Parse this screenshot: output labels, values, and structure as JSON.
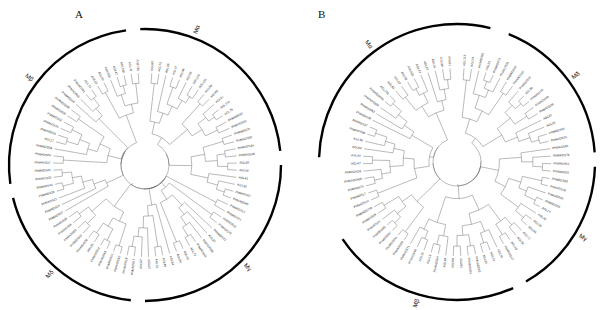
{
  "figure": {
    "background": "#ffffff",
    "width": 610,
    "height": 310,
    "branch_color": "#5a5a5a",
    "arc_color": "#000000",
    "label_color": "#2c2c2c"
  },
  "panels": [
    {
      "id": "A",
      "letter": "A",
      "letter_pos": {
        "x": 75,
        "y": 18
      },
      "center": {
        "x": 145,
        "y": 165
      },
      "radius": 142,
      "inner_radius": 22,
      "tip_radius": 92,
      "arc_radius": 136,
      "clades": [
        {
          "name": "Mδ",
          "label": "Mδ",
          "start_deg": 186,
          "end_deg": 256,
          "label_deg": 221
        },
        {
          "name": "Mβ",
          "label": "Mβ",
          "start_deg": 262,
          "end_deg": 352,
          "label_deg": 307
        },
        {
          "name": "Mα",
          "label": "Mα",
          "start_deg": 358,
          "end_deg": 84,
          "label_deg": 21
        },
        {
          "name": "Mγ",
          "label": "Mγ",
          "start_deg": 90,
          "end_deg": 180,
          "label_deg": 135
        }
      ],
      "tips": [
        "AGL63",
        "AGL73",
        "AGL56",
        "AGL67",
        "AGL96",
        "AGL58",
        "AGL102",
        "AGL101",
        "AGL59",
        "AGL93",
        "AGL91",
        "AGL104",
        "AGL79",
        "PhMADS22",
        "PhMADS45",
        "PhMADS29",
        "PhMADS30",
        "PhMADS34",
        "PhMADS49",
        "AGL40",
        "AGL90",
        "AGL41",
        "AGL92",
        "PhMADS57",
        "PhMADS60",
        "PhMADS12",
        "PhMADS74",
        "PhMADS11",
        "PhMADS70",
        "PhMADS72",
        "AGL30",
        "PhMADS38",
        "PhMADS41",
        "AGL72",
        "AGL62",
        "AGL80",
        "AGL84",
        "AGL46",
        "AGL61",
        "AGL52",
        "AGL87",
        "PhMADS17",
        "PhMADS18",
        "PhMADS62",
        "PhMADS51",
        "PhMADS65",
        "PhMADS24",
        "AGL26",
        "PhMADS09",
        "PhMADS03",
        "PhMADS69",
        "PhMADS64",
        "PhMADS35",
        "PhMADS27",
        "PhMADS54",
        "PhMADS21",
        "PhMADS39",
        "PhMADS44",
        "PhMADS20",
        "PhMADS43",
        "PhMADS07",
        "PhMADS56",
        "PhMADS58",
        "AGL17",
        "PhMADS19",
        "PhMADS25",
        "PhMADS02",
        "PhMADS05",
        "PhMADS58b",
        "PhMADS04",
        "PhMADS63",
        "PhMADS81",
        "AGL74",
        "AGL33",
        "AGL50",
        "AGL92b",
        "AGL47",
        "AGL56b",
        "AGL71",
        "AGL73b"
      ]
    },
    {
      "id": "B",
      "letter": "B",
      "letter_pos": {
        "x": 318,
        "y": 18
      },
      "center": {
        "x": 457,
        "y": 162
      },
      "radius": 145,
      "inner_radius": 22,
      "tip_radius": 94,
      "arc_radius": 138,
      "clades": [
        {
          "name": "Mβ",
          "label": "Mβ",
          "start_deg": 156,
          "end_deg": 236,
          "label_deg": 196
        },
        {
          "name": "Mγ",
          "label": "Mγ",
          "start_deg": 92,
          "end_deg": 150,
          "label_deg": 121
        },
        {
          "name": "Mδ",
          "label": "Mδ",
          "start_deg": 22,
          "end_deg": 86,
          "label_deg": 54
        },
        {
          "name": "Mα",
          "label": "Mα",
          "start_deg": 272,
          "end_deg": 14,
          "label_deg": 323
        }
      ],
      "tips": [
        "AGL113",
        "AGL24",
        "PhMADS01",
        "AGL59",
        "PhMADS73",
        "PhMADS31",
        "PhMADS02",
        "PhMADS42",
        "PhMADS32",
        "AGL29",
        "PhMADS06",
        "PhMADS36",
        "PhMADS08",
        "AGL97",
        "AGL35",
        "PhMADS44",
        "PhMADS33",
        "PhMADS61",
        "PhMADS78",
        "PhMADS51",
        "PhMADS92",
        "PhMADS25",
        "PhMADS38",
        "PhMADS34",
        "PhMADS63",
        "AGL74",
        "AGL33",
        "AGL30",
        "AGL56",
        "AGL72",
        "AGL52",
        "AGL39",
        "PhMADS67",
        "AGL34",
        "AGL31",
        "AGL20",
        "PhMADS43",
        "PhMADS04",
        "AGL62",
        "AGL80",
        "AGL84",
        "PhMADS64",
        "AGL16",
        "AGL22",
        "PhMADS48",
        "PhMADS71",
        "PhMADS60",
        "PhMADS54",
        "PhMADS57",
        "PhMADS65",
        "PhMADS41",
        "PhMADS09",
        "PhMADS73b",
        "PhMADS14",
        "PhMADS17",
        "PhMADS75",
        "PhMADS60b",
        "PhMADS26",
        "AGL47",
        "AGL92",
        "AGL64",
        "AGL50",
        "PhMADS58",
        "PhMADS37",
        "PhMADS39",
        "PhMADS53",
        "PhMADS36b",
        "PhMADS44b",
        "AGL103",
        "AGL51",
        "AGL57",
        "AGL58",
        "AGL62b",
        "AGL43",
        "AGL87",
        "AGL46",
        "AGL96",
        "AGL61"
      ]
    }
  ]
}
